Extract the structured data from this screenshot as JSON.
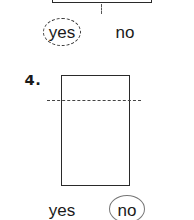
{
  "previous_problem": {
    "options": [
      {
        "label": "yes",
        "selected": true,
        "circle_style": "dashed"
      },
      {
        "label": "no",
        "selected": false
      }
    ]
  },
  "problem": {
    "number_label": "4.",
    "shape": "rectangle",
    "fold_line": "horizontal-dashed-off-center",
    "options": [
      {
        "label": "yes",
        "selected": false
      },
      {
        "label": "no",
        "selected": true,
        "circle_style": "solid"
      }
    ]
  },
  "colors": {
    "ink": "#1a1a1a",
    "line": "#2a2a2a",
    "answer_circle": "#777777",
    "background": "#ffffff"
  }
}
